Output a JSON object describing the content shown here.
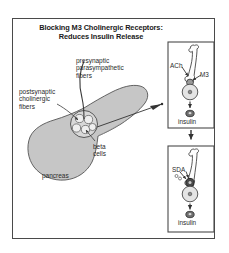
{
  "figure": {
    "title_line1": "Blocking M3 Cholinergic Receptors:",
    "title_line2": "Reduces Insulin Release",
    "frame_color": "#4a4a4a",
    "background_color": "#ffffff"
  },
  "pancreas_panel": {
    "organ_label": "pancreas",
    "organ_fill_color": "#c6c6c6",
    "organ_stroke_color": "#555555",
    "labels": {
      "presynaptic": {
        "line1": "presynaptic",
        "line2": "parasympathetic",
        "line3": "fibers"
      },
      "postsynaptic": {
        "line1": "postsynaptic",
        "line2": "cholinergic",
        "line3": "fibers"
      },
      "beta_cells": {
        "line1": "beta",
        "line2": "cells"
      }
    },
    "islet": {
      "beta_cell_count": 5,
      "fill_color": "#d8d8d8"
    }
  },
  "insets": [
    {
      "id": "top-inset",
      "name": "ach-m3-stimulation-panel",
      "neurotransmitter_label": "ACh",
      "receptor_label": "M3",
      "output_label": "insulin",
      "receptor_state": "active",
      "border_color": "#4a4a4a"
    },
    {
      "id": "bottom-inset",
      "name": "sda-blockade-panel",
      "neurotransmitter_label": "SDA",
      "receptor_label": "",
      "output_label": "insulin",
      "receptor_state": "blocked",
      "border_color": "#4a4a4a"
    }
  ],
  "connectors": {
    "islet_to_inset": "arrow",
    "inset_to_inset": "arrow-down"
  }
}
